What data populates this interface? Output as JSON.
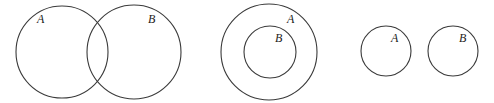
{
  "diagrams": [
    {
      "name": "overlapping",
      "circles": [
        {
          "label": "A",
          "cx": 62,
          "cy": 52,
          "r": 46,
          "lx": 37,
          "ly": 23
        },
        {
          "label": "B",
          "cx": 134,
          "cy": 52,
          "r": 47,
          "lx": 148,
          "ly": 23
        }
      ]
    },
    {
      "name": "subset",
      "circles": [
        {
          "label": "A",
          "cx": 269,
          "cy": 52,
          "r": 48,
          "lx": 287,
          "ly": 23
        },
        {
          "label": "B",
          "cx": 270,
          "cy": 52,
          "r": 26,
          "lx": 275,
          "ly": 42
        }
      ]
    },
    {
      "name": "disjoint",
      "circles": [
        {
          "label": "A",
          "cx": 386,
          "cy": 51,
          "r": 25,
          "lx": 391,
          "ly": 42
        },
        {
          "label": "B",
          "cx": 453,
          "cy": 51,
          "r": 25,
          "lx": 459,
          "ly": 42
        }
      ]
    }
  ],
  "labels": {
    "d1_a": "A",
    "d1_b": "B",
    "d2_a": "A",
    "d2_b": "B",
    "d3_a": "A",
    "d3_b": "B"
  }
}
